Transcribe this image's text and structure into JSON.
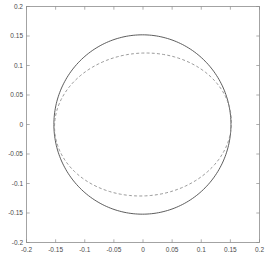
{
  "chart_data": {
    "type": "line",
    "title": "",
    "xlabel": "",
    "ylabel": "",
    "xlim": [
      -0.2,
      0.2
    ],
    "ylim": [
      -0.2,
      0.2
    ],
    "grid": false,
    "legend": "none",
    "background": "#ffffff",
    "frame_color": "#8d8d8d",
    "xticks": [
      -0.2,
      -0.15,
      -0.1,
      -0.05,
      0,
      0.05,
      0.1,
      0.15,
      0.2
    ],
    "xtick_labels": [
      "-0.2",
      "-0.15",
      "-0.1",
      "-0.05",
      "0",
      "0.05",
      "0.1",
      "0.15",
      "0.2"
    ],
    "yticks": [
      -0.2,
      -0.15,
      -0.1,
      -0.05,
      0,
      0.05,
      0.1,
      0.15,
      0.2
    ],
    "ytick_labels": [
      "-0.2",
      "-0.15",
      "-0.1",
      "-0.05",
      "0",
      "0.05",
      "0.1",
      "0.15",
      "0.2"
    ],
    "series": [
      {
        "name": "outer-circle",
        "style": "solid",
        "color": "#4b4b4b",
        "shape": "circle",
        "center": [
          -0.001,
          0.0
        ],
        "radius": 0.152,
        "x": [
          0.151,
          0.147,
          0.1352,
          0.1164,
          0.0916,
          0.0622,
          0.0297,
          -0.0041,
          -0.0379,
          -0.0703,
          -0.0998,
          -0.1245,
          -0.1434,
          -0.1552,
          -0.1592,
          -0.1552,
          -0.1434,
          -0.1245,
          -0.0998,
          -0.0703,
          -0.0379,
          -0.0041,
          0.0297,
          0.0622,
          0.0916,
          0.1164,
          0.1352,
          0.147,
          0.151
        ],
        "y": [
          0.0,
          0.0386,
          0.0746,
          0.1054,
          0.1292,
          0.1443,
          0.15,
          0.146,
          0.1326,
          0.1106,
          0.0814,
          0.047,
          0.0096,
          -0.0286,
          -0.065,
          -0.0975,
          -0.124,
          -0.1428,
          -0.1525,
          -0.1525,
          -0.1428,
          -0.124,
          -0.0975,
          -0.065,
          -0.0286,
          0.0096,
          0.047,
          0.0814,
          0.1106
        ]
      },
      {
        "name": "inner-ellipse",
        "style": "dashed",
        "color": "#8f8f8f",
        "shape": "ellipse",
        "center": [
          0.0,
          0.0
        ],
        "semi_major": 0.152,
        "semi_minor": 0.121,
        "rotation_deg": 4,
        "x": [
          0.1516,
          0.145,
          0.1275,
          0.1009,
          0.0678,
          0.0315,
          -0.0055,
          -0.0413,
          -0.0738,
          -0.1011,
          -0.1219,
          -0.135,
          -0.14,
          -0.1369,
          -0.126,
          -0.108,
          -0.0841,
          -0.0557,
          -0.0245,
          0.0077,
          0.0392,
          0.0683,
          0.0934,
          0.1133,
          0.1271,
          0.1343,
          0.1347,
          0.1286,
          0.1516
        ],
        "y": [
          -0.01,
          0.029,
          0.062,
          0.0873,
          0.1048,
          0.1146,
          0.1167,
          0.1113,
          0.0988,
          0.0799,
          0.0557,
          0.0276,
          -0.0028,
          -0.0335,
          -0.0622,
          -0.0869,
          -0.1058,
          -0.1177,
          -0.1216,
          -0.1176,
          -0.106,
          -0.0878,
          -0.0641,
          -0.0366,
          -0.0068,
          0.0236,
          0.0527,
          0.0788,
          -0.01
        ]
      }
    ]
  }
}
